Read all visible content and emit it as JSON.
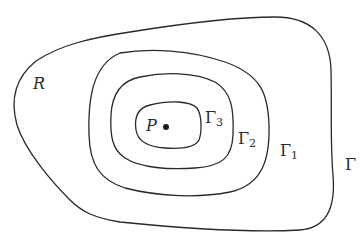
{
  "diagram": {
    "type": "nested-closed-curves",
    "colors": {
      "background": "#ffffff",
      "stroke": "#2a2a2a",
      "point": "#1a1a1a"
    },
    "region_label": "R",
    "point_label": "P",
    "curves": [
      {
        "name": "Gamma",
        "label": "Γ",
        "subscript": ""
      },
      {
        "name": "Gamma-1",
        "label": "Γ",
        "subscript": "1"
      },
      {
        "name": "Gamma-2",
        "label": "Γ",
        "subscript": "2"
      },
      {
        "name": "Gamma-3",
        "label": "Γ",
        "subscript": "3"
      }
    ]
  }
}
